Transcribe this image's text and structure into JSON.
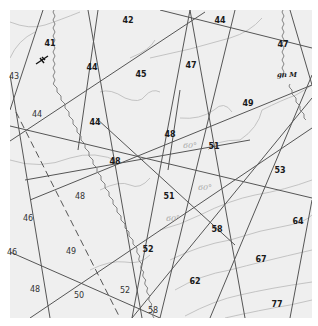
{
  "map": {
    "background": "#efefef",
    "frame": {
      "x": 10,
      "y": 10,
      "w": 302,
      "h": 308
    },
    "colors": {
      "line": "#555555",
      "contour": "#b5b5b5",
      "wavy": "#777777",
      "label": "#1a1a1a",
      "degree": "#aaaaaa"
    },
    "labels": [
      {
        "text": "42",
        "x": 128,
        "y": 21,
        "style": "bold"
      },
      {
        "text": "44",
        "x": 220,
        "y": 21,
        "style": "bold"
      },
      {
        "text": "41",
        "x": 50,
        "y": 44,
        "style": "bold"
      },
      {
        "text": "47",
        "x": 283,
        "y": 45,
        "style": "bold"
      },
      {
        "text": "43",
        "x": 14,
        "y": 77,
        "style": "light"
      },
      {
        "text": "44",
        "x": 92,
        "y": 68,
        "style": "bold"
      },
      {
        "text": "45",
        "x": 141,
        "y": 75,
        "style": "bold"
      },
      {
        "text": "47",
        "x": 191,
        "y": 66,
        "style": "bold"
      },
      {
        "text": "49",
        "x": 248,
        "y": 104,
        "style": "bold"
      },
      {
        "text": "44",
        "x": 37,
        "y": 115,
        "style": "light"
      },
      {
        "text": "44",
        "x": 95,
        "y": 123,
        "style": "bold"
      },
      {
        "text": "48",
        "x": 170,
        "y": 135,
        "style": "bold"
      },
      {
        "text": "48",
        "x": 115,
        "y": 162,
        "style": "bold"
      },
      {
        "text": "51",
        "x": 214,
        "y": 147,
        "style": "bold"
      },
      {
        "text": "53",
        "x": 280,
        "y": 171,
        "style": "bold"
      },
      {
        "text": "48",
        "x": 80,
        "y": 197,
        "style": "light"
      },
      {
        "text": "51",
        "x": 169,
        "y": 197,
        "style": "bold"
      },
      {
        "text": "46",
        "x": 28,
        "y": 219,
        "style": "light"
      },
      {
        "text": "58",
        "x": 217,
        "y": 230,
        "style": "bold"
      },
      {
        "text": "64",
        "x": 298,
        "y": 222,
        "style": "bold"
      },
      {
        "text": "46",
        "x": 12,
        "y": 253,
        "style": "light"
      },
      {
        "text": "49",
        "x": 71,
        "y": 252,
        "style": "light"
      },
      {
        "text": "52",
        "x": 148,
        "y": 250,
        "style": "bold"
      },
      {
        "text": "67",
        "x": 261,
        "y": 260,
        "style": "bold"
      },
      {
        "text": "62",
        "x": 195,
        "y": 282,
        "style": "bold"
      },
      {
        "text": "48",
        "x": 35,
        "y": 290,
        "style": "light"
      },
      {
        "text": "50",
        "x": 79,
        "y": 296,
        "style": "light"
      },
      {
        "text": "52",
        "x": 125,
        "y": 291,
        "style": "light"
      },
      {
        "text": "77",
        "x": 277,
        "y": 305,
        "style": "bold"
      },
      {
        "text": "58",
        "x": 153,
        "y": 311,
        "style": "light"
      }
    ],
    "degree_labels": [
      {
        "text": "60°",
        "x": 190,
        "y": 146
      },
      {
        "text": "60°",
        "x": 205,
        "y": 188
      },
      {
        "text": "60°",
        "x": 173,
        "y": 219
      }
    ],
    "annotations": [
      {
        "text": "gn M",
        "x": 287,
        "y": 74
      }
    ],
    "symbols": [
      {
        "name": "strike-dip-symbol",
        "x": 42,
        "y": 60
      }
    ]
  }
}
